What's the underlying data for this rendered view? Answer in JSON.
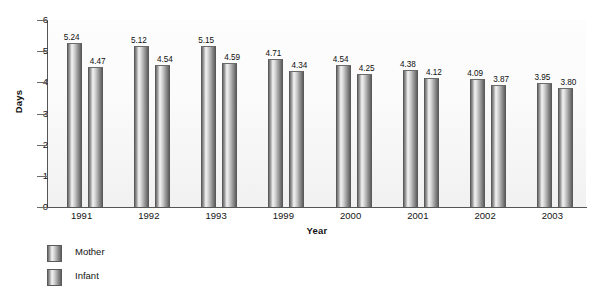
{
  "chart_data": {
    "type": "bar",
    "title": "",
    "subtitle": "",
    "xlabel": "Year",
    "ylabel": "Days",
    "categories": [
      "1991",
      "1992",
      "1993",
      "1999",
      "2000",
      "2001",
      "2002",
      "2003"
    ],
    "series": [
      {
        "name": "Mother",
        "values": [
          5.24,
          5.12,
          5.15,
          4.71,
          4.54,
          4.38,
          4.09,
          3.95
        ]
      },
      {
        "name": "Infant",
        "values": [
          4.47,
          4.54,
          4.59,
          4.34,
          4.25,
          4.12,
          3.87,
          3.8
        ]
      }
    ],
    "value_labels": [
      [
        "5.24",
        "4.47"
      ],
      [
        "5.12",
        "4.54"
      ],
      [
        "5.15",
        "4.59"
      ],
      [
        "4.71",
        "4.34"
      ],
      [
        "4.54",
        "4.25"
      ],
      [
        "4.38",
        "4.12"
      ],
      [
        "4.09",
        "3.87"
      ],
      [
        "3.95",
        "3.80"
      ]
    ],
    "ylim": [
      0,
      6
    ],
    "y_ticks": [
      "0",
      "1",
      "2",
      "3",
      "4",
      "5",
      "6"
    ],
    "grid": false,
    "legend_position": "bottom-left",
    "bar_style": "cylinder-gradient",
    "colors": {
      "bar_light": "#f4f4f4",
      "bar_mid": "#9d9d9d",
      "bar_dark": "#5f5f5f",
      "axis": "#555555",
      "text": "#141414",
      "plot_background": "#fbfbfb"
    }
  },
  "legend": {
    "items": [
      {
        "label": "Mother"
      },
      {
        "label": "Infant"
      }
    ]
  }
}
